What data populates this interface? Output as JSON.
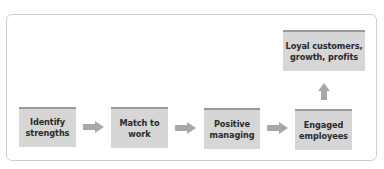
{
  "diagram": {
    "type": "flowchart",
    "steps": [
      {
        "id": "identify",
        "label_lines": [
          "Identify",
          "strengths"
        ]
      },
      {
        "id": "match",
        "label_lines": [
          "Match to",
          "work"
        ]
      },
      {
        "id": "positive",
        "label_lines": [
          "Positive",
          "managing"
        ]
      },
      {
        "id": "engaged",
        "label_lines": [
          "Engaged",
          "employees"
        ]
      },
      {
        "id": "outcome",
        "label_lines": [
          "Loyal customers,",
          "growth, profits"
        ]
      }
    ],
    "connections": [
      {
        "from": "identify",
        "to": "match",
        "icon": "arrow-right-icon"
      },
      {
        "from": "match",
        "to": "positive",
        "icon": "arrow-right-icon"
      },
      {
        "from": "positive",
        "to": "engaged",
        "icon": "arrow-right-icon"
      },
      {
        "from": "engaged",
        "to": "outcome",
        "icon": "arrow-up-icon"
      }
    ],
    "colors": {
      "box_fill": "#d6d6d6",
      "box_top_border": "#9a9a9a",
      "arrow": "#a8a8a8",
      "frame_border": "#cfcfcf",
      "text": "#2a2a2a"
    }
  }
}
